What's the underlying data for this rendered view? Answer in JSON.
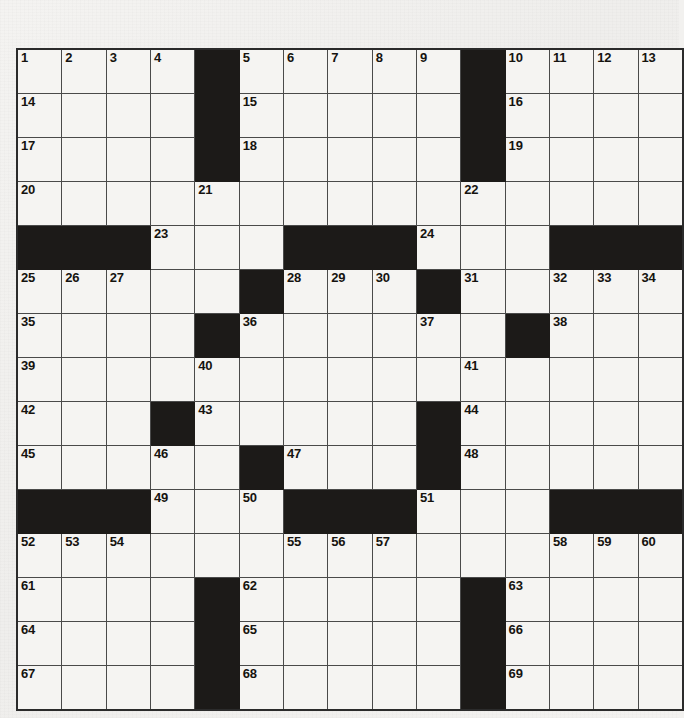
{
  "puzzle": {
    "type": "crossword-grid",
    "rows": 15,
    "columns": 15,
    "colors": {
      "paper": "#f2f1ef",
      "cell_fill": "#f5f4f2",
      "block_fill": "#1c1a18",
      "grid_line": "#4a4a4a",
      "border": "#2b2b2b",
      "number_text": "#15130f"
    },
    "legend": {
      "black_cell": "block",
      "white_cell": "open"
    },
    "grid": [
      [
        "1",
        "2",
        "3",
        "4",
        "#",
        "5",
        "6",
        "7",
        "8",
        "9",
        "#",
        "10",
        "11",
        "12",
        "13"
      ],
      [
        "14",
        "",
        "",
        "",
        "#",
        "15",
        "",
        "",
        "",
        "",
        "#",
        "16",
        "",
        "",
        ""
      ],
      [
        "17",
        "",
        "",
        "",
        "#",
        "18",
        "",
        "",
        "",
        "",
        "#",
        "19",
        "",
        "",
        ""
      ],
      [
        "20",
        "",
        "",
        "",
        "21",
        "",
        "",
        "",
        "",
        "",
        "22",
        "",
        "",
        "",
        ""
      ],
      [
        "#",
        "#",
        "#",
        "23",
        "",
        "",
        "#",
        "#",
        "#",
        "24",
        "",
        "",
        "#",
        "#",
        "#"
      ],
      [
        "25",
        "26",
        "27",
        "",
        "",
        "#",
        "28",
        "29",
        "30",
        "#",
        "31",
        "",
        "32",
        "33",
        "34"
      ],
      [
        "35",
        "",
        "",
        "",
        "#",
        "36",
        "",
        "",
        "",
        "37",
        "",
        "#",
        "38",
        "",
        ""
      ],
      [
        "39",
        "",
        "",
        "",
        "40",
        "",
        "",
        "",
        "",
        "",
        "41",
        "",
        "",
        "",
        ""
      ],
      [
        "42",
        "",
        "",
        "#",
        "43",
        "",
        "",
        "",
        "",
        "#",
        "44",
        "",
        "",
        "",
        ""
      ],
      [
        "45",
        "",
        "",
        "46",
        "",
        "#",
        "47",
        "",
        "",
        "#",
        "48",
        "",
        "",
        "",
        ""
      ],
      [
        "#",
        "#",
        "#",
        "49",
        "",
        "50",
        "#",
        "#",
        "#",
        "51",
        "",
        "",
        "#",
        "#",
        "#"
      ],
      [
        "52",
        "53",
        "54",
        "",
        "",
        "",
        "55",
        "56",
        "57",
        "",
        "",
        "",
        "58",
        "59",
        "60"
      ],
      [
        "61",
        "",
        "",
        "",
        "#",
        "62",
        "",
        "",
        "",
        "",
        "#",
        "63",
        "",
        "",
        ""
      ],
      [
        "64",
        "",
        "",
        "",
        "#",
        "65",
        "",
        "",
        "",
        "",
        "#",
        "66",
        "",
        "",
        ""
      ],
      [
        "67",
        "",
        "",
        "",
        "#",
        "68",
        "",
        "",
        "",
        "",
        "#",
        "69",
        "",
        "",
        ""
      ]
    ],
    "numbers": [
      "1",
      "2",
      "3",
      "4",
      "5",
      "6",
      "7",
      "8",
      "9",
      "10",
      "11",
      "12",
      "13",
      "14",
      "15",
      "16",
      "17",
      "18",
      "19",
      "20",
      "21",
      "22",
      "23",
      "24",
      "25",
      "26",
      "27",
      "28",
      "29",
      "30",
      "31",
      "32",
      "33",
      "34",
      "35",
      "36",
      "37",
      "38",
      "39",
      "40",
      "41",
      "42",
      "43",
      "44",
      "45",
      "46",
      "47",
      "48",
      "49",
      "50",
      "51",
      "52",
      "53",
      "54",
      "55",
      "56",
      "57",
      "58",
      "59",
      "60",
      "61",
      "62",
      "63",
      "64",
      "65",
      "66",
      "67",
      "68",
      "69"
    ],
    "total_numbered_cells": 69
  }
}
